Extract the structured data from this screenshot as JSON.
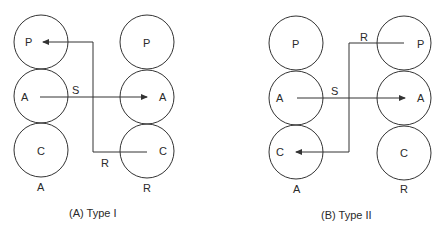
{
  "diagrams": [
    {
      "id": "type1",
      "caption": "(A) Type I",
      "columns": [
        {
          "label": "A",
          "circles": [
            "P",
            "A",
            "C"
          ]
        },
        {
          "label": "R",
          "circles": [
            "P",
            "A",
            "C"
          ]
        }
      ],
      "arrows": [
        {
          "label": "S",
          "from": "A:A",
          "to": "R:A"
        },
        {
          "label": "R",
          "from": "R:C",
          "to": "A:P"
        }
      ]
    },
    {
      "id": "type2",
      "caption": "(B) Type II",
      "columns": [
        {
          "label": "A",
          "circles": [
            "P",
            "A",
            "C"
          ]
        },
        {
          "label": "R",
          "circles": [
            "P",
            "A",
            "C"
          ]
        }
      ],
      "arrows": [
        {
          "label": "S",
          "from": "A:A",
          "to": "R:A"
        },
        {
          "label": "R",
          "from": "R:P",
          "to": "A:C"
        }
      ]
    }
  ],
  "colors": {
    "stroke": "#333333",
    "text": "#2a2a2a",
    "background": "#ffffff"
  }
}
